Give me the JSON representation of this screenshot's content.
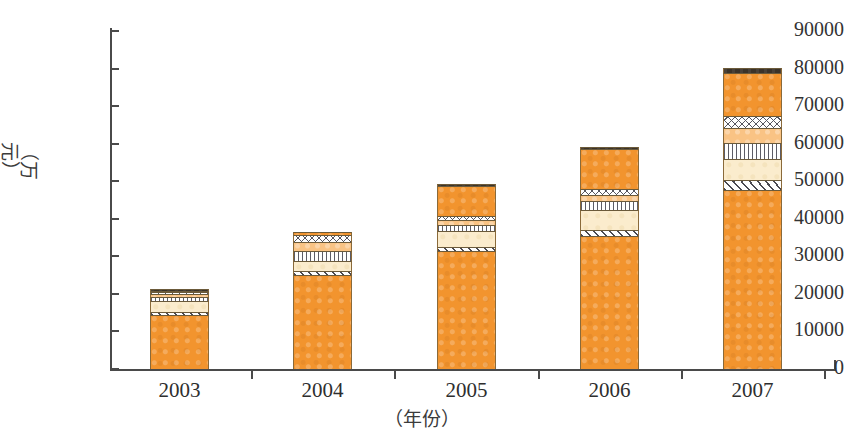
{
  "chart_data": {
    "type": "bar",
    "title": "",
    "subtitle": "",
    "xlabel": "（年份）",
    "ylabel": "（万元）",
    "categories": [
      "2003",
      "2004",
      "2005",
      "2006",
      "2007"
    ],
    "ylim": [
      0,
      90000
    ],
    "ytick_labels": [
      "0",
      "10000",
      "20000",
      "30000",
      "40000",
      "50000",
      "60000",
      "70000",
      "80000",
      "90000"
    ],
    "ytick_values": [
      0,
      10000,
      20000,
      30000,
      40000,
      50000,
      60000,
      70000,
      80000,
      90000
    ],
    "grid": false,
    "legend": "none",
    "stacked": true,
    "series": [
      {
        "name": "segment-1-solid-orange",
        "pattern": "solid-orange",
        "color": "#f2942e",
        "values": [
          14300,
          25000,
          31300,
          35400,
          47700
        ]
      },
      {
        "name": "segment-2-diagonal-hatch",
        "pattern": "diagonal-hatch",
        "color": "#ffffff",
        "values": [
          800,
          1100,
          1300,
          1500,
          2500
        ]
      },
      {
        "name": "segment-3-cream",
        "pattern": "solid-cream",
        "color": "#fbeccd",
        "values": [
          2900,
          2600,
          4200,
          5400,
          5800
        ]
      },
      {
        "name": "segment-4-vertical-stripe",
        "pattern": "vertical-stripes",
        "color": "#ffffff",
        "values": [
          1300,
          2600,
          1500,
          2400,
          4200
        ]
      },
      {
        "name": "segment-5-light-orange",
        "pattern": "light-orange",
        "color": "#f9c384",
        "values": [
          600,
          2500,
          1400,
          1500,
          4000
        ]
      },
      {
        "name": "segment-6-scallop",
        "pattern": "scallop-circles",
        "color": "#ffffff",
        "values": [
          600,
          1800,
          1100,
          1800,
          3100
        ]
      },
      {
        "name": "segment-7-orange-top",
        "pattern": "solid-orange",
        "color": "#f2942e",
        "values": [
          400,
          800,
          7800,
          10500,
          11400
        ]
      },
      {
        "name": "segment-8-dark-cap",
        "pattern": "dark",
        "color": "#3b3329",
        "values": [
          300,
          200,
          600,
          700,
          1400
        ]
      }
    ],
    "totals": [
      21200,
      36600,
      49200,
      59200,
      80100
    ]
  },
  "axis": {
    "y_title": "（万元）",
    "x_title": "（年份）"
  }
}
